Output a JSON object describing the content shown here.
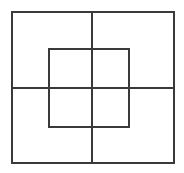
{
  "figure": {
    "background_color": "#ffffff",
    "width": 184,
    "height": 173
  },
  "style": {
    "stroke_color": "#3a3a3a",
    "stroke_color_light": "#555555",
    "stroke_width_outer": 2,
    "stroke_width_inner": 1.6,
    "stroke_width_cross": 1.8
  },
  "chart_data": {
    "type": "diagram",
    "units": "pixels",
    "xlim": [
      0,
      184
    ],
    "ylim": [
      0,
      173
    ],
    "grid": false,
    "legend": false,
    "shapes": [
      {
        "name": "outer-square",
        "kind": "rectangle",
        "x": 11,
        "y": 11,
        "width": 164,
        "height": 153,
        "stroke": "#3a3a3a",
        "stroke_width": 2,
        "fill": "none"
      },
      {
        "name": "inner-square",
        "kind": "rectangle",
        "x": 48,
        "y": 48,
        "width": 82,
        "height": 80,
        "stroke": "#3a3a3a",
        "stroke_width": 1.6,
        "fill": "none"
      },
      {
        "name": "vertical-bisector",
        "kind": "line",
        "x1": 92,
        "y1": 11,
        "x2": 92,
        "y2": 164,
        "stroke": "#3a3a3a",
        "stroke_width": 1.8
      },
      {
        "name": "horizontal-bisector",
        "kind": "line",
        "x1": 11,
        "y1": 88,
        "x2": 175,
        "y2": 88,
        "stroke": "#3a3a3a",
        "stroke_width": 1.8
      }
    ],
    "intersections": [
      {
        "name": "center",
        "x": 92,
        "y": 88
      },
      {
        "name": "inner-left-horizontal",
        "x": 48,
        "y": 88
      },
      {
        "name": "inner-right-horizontal",
        "x": 130,
        "y": 88
      },
      {
        "name": "inner-top-vertical",
        "x": 92,
        "y": 48
      },
      {
        "name": "inner-bottom-vertical",
        "x": 92,
        "y": 128
      }
    ]
  }
}
